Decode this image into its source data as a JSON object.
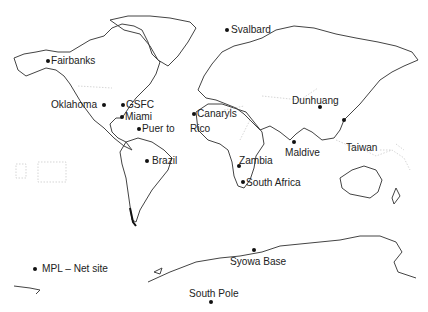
{
  "map": {
    "type": "world-map",
    "style": "black-and-white outline",
    "sites": [
      {
        "id": "fairbanks",
        "label": "Fairbanks",
        "dot": [
          48,
          61
        ],
        "label_pos": [
          51,
          54
        ],
        "label_side": "right"
      },
      {
        "id": "oklahoma",
        "label": "Oklahoma",
        "dot": [
          104,
          105
        ],
        "label_pos": [
          51,
          98
        ],
        "label_side": "left"
      },
      {
        "id": "gsfc",
        "label": "GSFC",
        "dot": [
          123,
          105
        ],
        "label_pos": [
          126,
          98
        ],
        "label_side": "right"
      },
      {
        "id": "miami",
        "label": "Miami",
        "dot": [
          122,
          117
        ],
        "label_pos": [
          125,
          110
        ],
        "label_side": "right"
      },
      {
        "id": "puerto-rico",
        "label": "Puer to",
        "dot": [
          139,
          129
        ],
        "label_pos": [
          142,
          122
        ],
        "label_side": "right"
      },
      {
        "id": "puerto-rico-cont",
        "label": "Rico",
        "dot": null,
        "label_pos": [
          190,
          122
        ],
        "label_side": "right"
      },
      {
        "id": "canary-islands",
        "label": "Canaryls",
        "dot": [
          194,
          114
        ],
        "label_pos": [
          197,
          107
        ],
        "label_side": "right"
      },
      {
        "id": "svalbard",
        "label": "Svalbard",
        "dot": [
          227,
          30
        ],
        "label_pos": [
          231,
          23
        ],
        "label_side": "right"
      },
      {
        "id": "dunhuang",
        "label": "Dunhuang",
        "dot": [
          320,
          107
        ],
        "label_pos": [
          292,
          94
        ],
        "label_side": "above-left"
      },
      {
        "id": "taiwan",
        "label": "Taiwan",
        "dot": [
          344,
          120
        ],
        "label_pos": [
          346,
          141
        ],
        "label_side": "right"
      },
      {
        "id": "maldive",
        "label": "Maldive",
        "dot": [
          294,
          142
        ],
        "label_pos": [
          285,
          146
        ],
        "label_side": "below"
      },
      {
        "id": "zambia",
        "label": "Zambia",
        "dot": [
          239,
          166
        ],
        "label_pos": [
          239,
          154
        ],
        "label_side": "right"
      },
      {
        "id": "south-africa",
        "label": "South Africa",
        "dot": [
          243,
          182
        ],
        "label_pos": [
          246,
          176
        ],
        "label_side": "right"
      },
      {
        "id": "brazil",
        "label": "Brazil",
        "dot": [
          147,
          161
        ],
        "label_pos": [
          152,
          154
        ],
        "label_side": "right"
      },
      {
        "id": "syowa-base",
        "label": "Syowa Base",
        "dot": [
          254,
          250
        ],
        "label_pos": [
          230,
          255
        ],
        "label_side": "below"
      },
      {
        "id": "south-pole",
        "label": "South Pole",
        "dot": [
          211,
          302
        ],
        "label_pos": [
          189,
          287
        ],
        "label_side": "above"
      }
    ],
    "legend": {
      "label": "MPL – Net site",
      "dot": [
        35,
        269
      ],
      "label_pos": [
        42,
        262
      ]
    }
  }
}
